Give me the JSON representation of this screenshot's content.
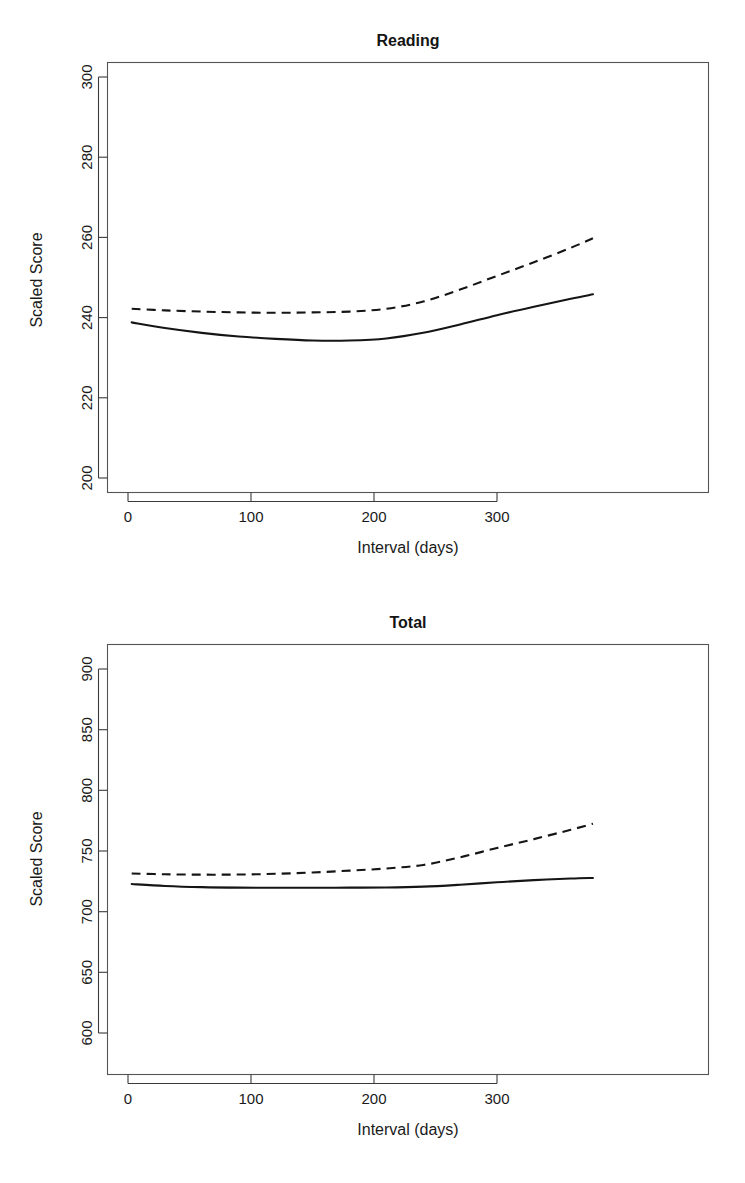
{
  "figure": {
    "panel_count": 2,
    "background_color": "#ffffff",
    "line_color": "#151515"
  },
  "chart_data": [
    {
      "type": "line",
      "title": "Reading",
      "xlabel": "Interval (days)",
      "ylabel": "Scaled Score",
      "xlim": [
        -15,
        390
      ],
      "ylim": [
        197,
        307
      ],
      "xticks": [
        0,
        100,
        200,
        300
      ],
      "xticklabels": [
        "0",
        "100",
        "200",
        "300"
      ],
      "yticks": [
        200,
        220,
        240,
        260,
        280,
        300
      ],
      "yticklabels": [
        "200",
        "220",
        "240",
        "260",
        "280",
        "300"
      ],
      "grid": false,
      "legend": null,
      "x": [
        3,
        30,
        60,
        90,
        120,
        150,
        180,
        210,
        240,
        270,
        300,
        330,
        360,
        378
      ],
      "series": [
        {
          "name": "solid",
          "linestyle": "solid",
          "values": [
            238.8,
            237.4,
            236.2,
            235.3,
            234.7,
            234.3,
            234.3,
            234.8,
            236.2,
            238.3,
            240.6,
            242.7,
            244.7,
            245.8
          ]
        },
        {
          "name": "dashed",
          "linestyle": "dashed",
          "values": [
            242.2,
            241.8,
            241.5,
            241.3,
            241.2,
            241.3,
            241.5,
            242.2,
            244.0,
            247.0,
            250.4,
            253.8,
            257.4,
            259.8
          ]
        }
      ]
    },
    {
      "type": "line",
      "title": "Total",
      "xlabel": "Interval (days)",
      "ylabel": "Scaled Score",
      "xlim": [
        -15,
        390
      ],
      "ylim": [
        592,
        912
      ],
      "xticks": [
        0,
        100,
        200,
        300
      ],
      "xticklabels": [
        "0",
        "100",
        "200",
        "300"
      ],
      "yticks": [
        600,
        650,
        700,
        750,
        800,
        850,
        900
      ],
      "yticklabels": [
        "600",
        "650",
        "700",
        "750",
        "800",
        "850",
        "900"
      ],
      "grid": false,
      "legend": null,
      "x": [
        3,
        30,
        60,
        90,
        120,
        150,
        180,
        210,
        240,
        270,
        300,
        330,
        360,
        378
      ],
      "series": [
        {
          "name": "solid",
          "linestyle": "solid",
          "values": [
            722.8,
            721.2,
            720.2,
            719.8,
            719.7,
            719.7,
            719.8,
            719.9,
            720.6,
            722.2,
            724.2,
            726.0,
            727.3,
            727.8
          ]
        },
        {
          "name": "dashed",
          "linestyle": "dashed",
          "values": [
            731.5,
            730.8,
            730.5,
            730.6,
            731.2,
            732.3,
            733.8,
            735.6,
            738.5,
            744.8,
            752.5,
            759.8,
            767.5,
            772.5
          ]
        }
      ]
    }
  ]
}
